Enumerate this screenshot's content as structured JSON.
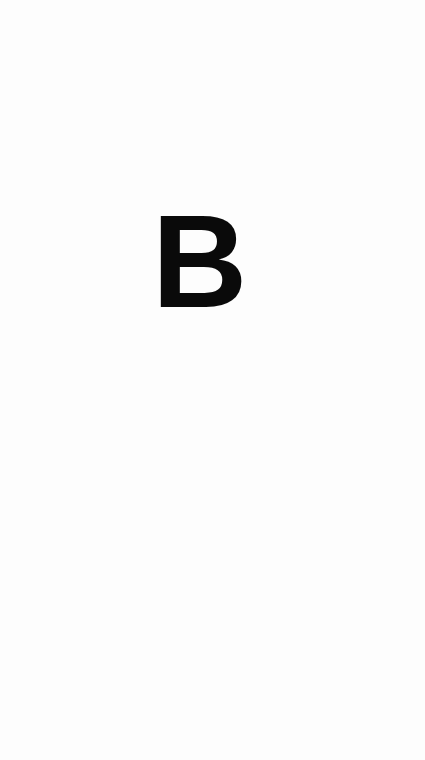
{
  "page": {
    "background_color": "#fdfdfd"
  },
  "letter": {
    "text": "B",
    "color": "#0a0a0a"
  }
}
